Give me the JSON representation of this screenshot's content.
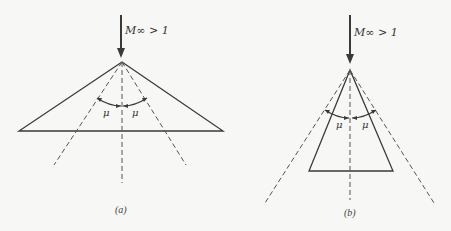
{
  "figures": [
    {
      "id": "a",
      "caption": "(a)",
      "flow_label": "M∞ > 1",
      "angle_label_left": "μ",
      "angle_label_right": "μ",
      "description": "Wide wedge; Mach lines lie inside the body surface"
    },
    {
      "id": "b",
      "caption": "(b)",
      "flow_label": "M∞ > 1",
      "angle_label_left": "μ",
      "angle_label_right": "μ",
      "description": "Slender wedge; Mach lines lie outside the body surface"
    }
  ],
  "colors": {
    "background": "#f7f7f5",
    "line": "#3a3a3a"
  }
}
